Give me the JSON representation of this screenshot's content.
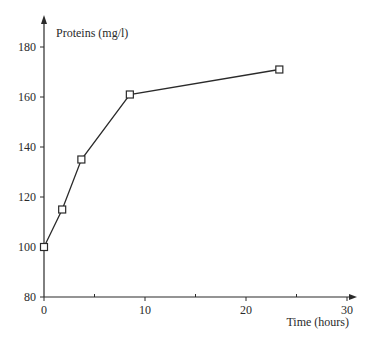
{
  "chart_data": {
    "type": "line",
    "title": "",
    "xlabel": "Time (hours)",
    "ylabel": "Proteins (mg/l)",
    "xlim": [
      0,
      30
    ],
    "ylim": [
      80,
      190
    ],
    "x_ticks": [
      0,
      10,
      20,
      30
    ],
    "x_minor_ticks": [
      5,
      15,
      25
    ],
    "y_ticks": [
      80,
      100,
      120,
      140,
      160,
      180
    ],
    "grid": false,
    "legend": null,
    "marker": "open-square",
    "series": [
      {
        "name": "Proteins",
        "x": [
          0,
          1.8,
          3.7,
          8.5,
          23.3
        ],
        "values": [
          100,
          115,
          135,
          161,
          171
        ]
      }
    ]
  },
  "colors": {
    "line": "#2a2a2a",
    "background": "#ffffff"
  }
}
